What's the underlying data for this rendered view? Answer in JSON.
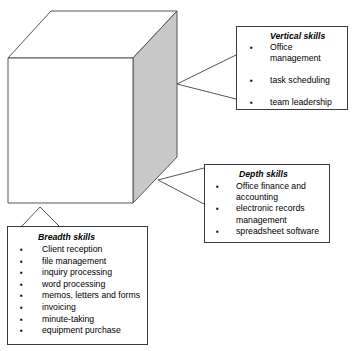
{
  "diagram": {
    "cube": {
      "name": "skills-cube",
      "front_face_color": "#ffffff",
      "side_face_color": "#c8c8c8",
      "top_face_color": "#ffffff",
      "outline_color": "#555555"
    },
    "callouts": [
      {
        "id": "vertical",
        "title": "Vertical skills",
        "items": [
          "Office management",
          "task scheduling",
          "team leadership"
        ]
      },
      {
        "id": "depth",
        "title": "Depth skills",
        "items": [
          "Office finance and accounting",
          "electronic records management",
          "spreadsheet software"
        ]
      },
      {
        "id": "breadth",
        "title": "Breadth skills",
        "items": [
          "Client reception",
          "file management",
          "inquiry processing",
          "word processing",
          "memos, letters and forms",
          "invoicing",
          "minute-taking",
          "equipment purchase"
        ]
      }
    ],
    "bullet_glyph": "▪"
  }
}
